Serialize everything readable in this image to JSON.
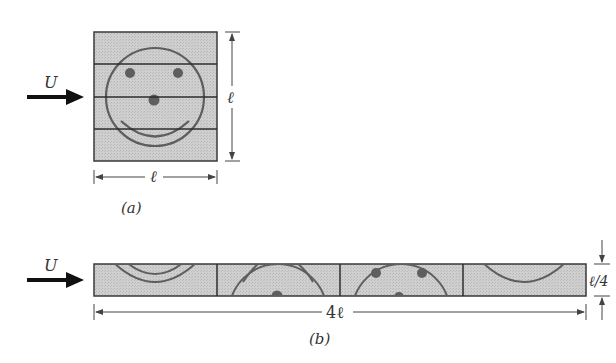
{
  "figure": {
    "panel_a": {
      "caption": "(a)",
      "flow_label": "U",
      "width_label": "ℓ",
      "height_label": "ℓ",
      "strips": 4,
      "content": "smiley-face"
    },
    "panel_b": {
      "caption": "(b)",
      "flow_label": "U",
      "length_label": "4ℓ",
      "height_label": "ℓ/4",
      "segments": 4
    },
    "colors": {
      "fill": "#c8c8c8",
      "stroke": "#3a3a3a",
      "face": "#5e5e5e",
      "dims": "#444444"
    }
  }
}
